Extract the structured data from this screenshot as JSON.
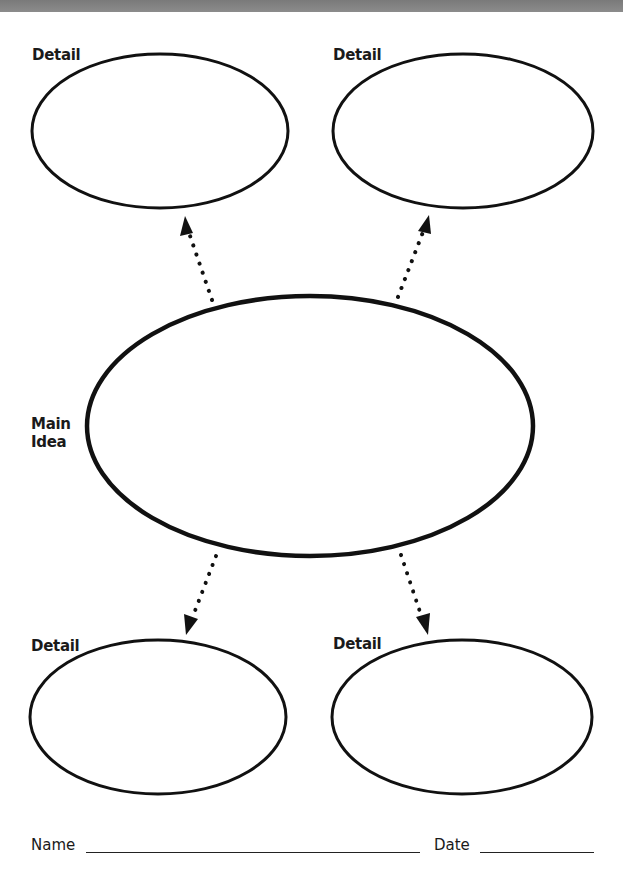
{
  "worksheet": {
    "title": "Main Idea and Details Graphic Organizer",
    "main_idea": {
      "label_line1": "Main",
      "label_line2": "Idea"
    },
    "details": [
      {
        "position": "top-left",
        "label": "Detail"
      },
      {
        "position": "top-right",
        "label": "Detail"
      },
      {
        "position": "bottom-left",
        "label": "Detail"
      },
      {
        "position": "bottom-right",
        "label": "Detail"
      }
    ],
    "arrows": [
      {
        "from": "main-idea",
        "to": "top-left-detail",
        "style": "dotted"
      },
      {
        "from": "main-idea",
        "to": "top-right-detail",
        "style": "dotted"
      },
      {
        "from": "main-idea",
        "to": "bottom-left-detail",
        "style": "dotted"
      },
      {
        "from": "main-idea",
        "to": "bottom-right-detail",
        "style": "dotted"
      }
    ],
    "footer": {
      "name_label": "Name",
      "name_value": "",
      "date_label": "Date",
      "date_value": ""
    }
  },
  "colors": {
    "ink": "#111111",
    "paper": "#ffffff",
    "top_bar": "#828282"
  }
}
